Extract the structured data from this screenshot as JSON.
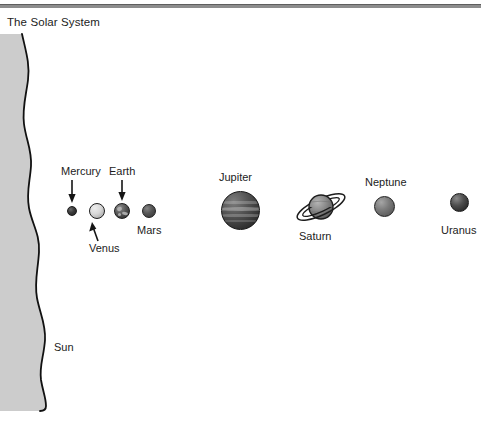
{
  "figure": {
    "title": "The Solar System",
    "background_color": "#ffffff",
    "rule_color": "#8d8d8d",
    "width": 481,
    "height": 425
  },
  "sun": {
    "label": "Sun",
    "fill_color": "#cccccc",
    "outline_color": "#111111",
    "description": "Large gray wedge at left edge with wavy right limb representing the Sun's scale"
  },
  "planets": [
    {
      "name": "Mercury",
      "label": "Mercury",
      "label_position": "above",
      "has_arrow": true,
      "arrow_direction": "down",
      "color": "#3a3a3a",
      "diameter_px": 10,
      "center_x": 72,
      "center_y": 211,
      "has_rings": false
    },
    {
      "name": "Venus",
      "label": "Venus",
      "label_position": "below",
      "has_arrow": true,
      "arrow_direction": "up-right",
      "color": "#d8d8d8",
      "diameter_px": 16,
      "center_x": 97,
      "center_y": 211,
      "has_rings": false
    },
    {
      "name": "Earth",
      "label": "Earth",
      "label_position": "above",
      "has_arrow": true,
      "arrow_direction": "down",
      "color": "#5c5c5c",
      "diameter_px": 16,
      "center_x": 122,
      "center_y": 211,
      "has_rings": false
    },
    {
      "name": "Mars",
      "label": "Mars",
      "label_position": "below-right",
      "has_arrow": false,
      "arrow_direction": "",
      "color": "#555555",
      "diameter_px": 14,
      "center_x": 149,
      "center_y": 211,
      "has_rings": false
    },
    {
      "name": "Jupiter",
      "label": "Jupiter",
      "label_position": "above",
      "has_arrow": false,
      "arrow_direction": "",
      "color": "#545454",
      "diameter_px": 39,
      "center_x": 240,
      "center_y": 210,
      "has_rings": false
    },
    {
      "name": "Saturn",
      "label": "Saturn",
      "label_position": "below",
      "has_arrow": false,
      "arrow_direction": "",
      "color": "#8f8f8f",
      "diameter_px": 24,
      "center_x": 321,
      "center_y": 207,
      "has_rings": true
    },
    {
      "name": "Neptune",
      "label": "Neptune",
      "label_position": "above",
      "has_arrow": false,
      "arrow_direction": "",
      "color": "#7b7b7b",
      "diameter_px": 21,
      "center_x": 384,
      "center_y": 206,
      "has_rings": false
    },
    {
      "name": "Uranus",
      "label": "Uranus",
      "label_position": "below",
      "has_arrow": false,
      "arrow_direction": "",
      "color": "#4e4e4e",
      "diameter_px": 19,
      "center_x": 459,
      "center_y": 202,
      "has_rings": false
    }
  ]
}
